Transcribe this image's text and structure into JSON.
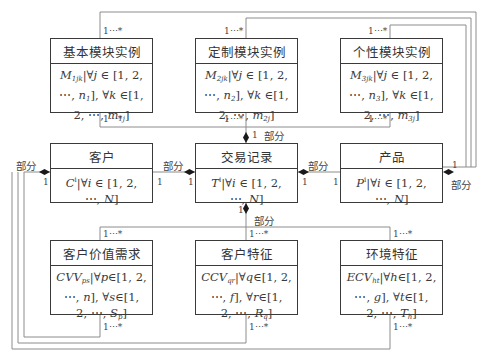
{
  "diagram": {
    "type": "uml-class-diagram",
    "classes": {
      "basic_module": {
        "name": "基本模块实例",
        "attr_lines": [
          "M<sub>1jk</sub>|∀<i>j</i> ∈ [1, 2,",
          "⋯, <i>n</i><sub>1</sub>], ∀<i>k</i> ∈[1,",
          "2, ⋯, <i>m</i><sub>1j</sub>]"
        ],
        "attr_text": "M1jk|∀j ∈ [1, 2, ⋯, n1], ∀k ∈[1, 2, ⋯, m1j]"
      },
      "custom_module": {
        "name": "定制模块实例",
        "attr_text": "M2jk|∀j ∈ [1, 2, ⋯, n2], ∀k ∈[1, 2, ⋯, m2j]"
      },
      "personal_module": {
        "name": "个性模块实例",
        "attr_text": "M3jk|∀j ∈ [1, 2, ⋯, n3], ∀k ∈[1, 2, ⋯, m3j]"
      },
      "customer": {
        "name": "客户",
        "attr_text": "C^i|∀i ∈ [1, 2, ⋯, N]"
      },
      "transaction": {
        "name": "交易记录",
        "attr_text": "T^i|∀i ∈ [1, 2, ⋯, N]"
      },
      "product": {
        "name": "产品",
        "attr_text": "P^i|∀i ∈ [1, 2, ⋯, N]"
      },
      "customer_value_need": {
        "name": "客户价值需求",
        "attr_text": "CVVps|∀p∈[1, 2, ⋯, n], ∀s∈[1, 2, ⋯, Sp]"
      },
      "customer_feature": {
        "name": "客户特征",
        "attr_text": "CCVqr|∀q∈[1, 2, ⋯, f], ∀r∈[1, 2, ⋯, Rq]"
      },
      "environment_feature": {
        "name": "环境特征",
        "attr_text": "ECVht|∀h∈[1, 2, ⋯, g], ∀t∈[1, 2, ⋯, Th]"
      }
    },
    "labels": {
      "part": "部分",
      "one": "1",
      "one_to_many": "1⋯*"
    },
    "relations": [
      {
        "from": "transaction",
        "to": "basic_module",
        "type": "composition",
        "whole_mult": "1",
        "part_mult": "1⋯*",
        "role": "部分"
      },
      {
        "from": "transaction",
        "to": "custom_module",
        "type": "composition",
        "whole_mult": "1",
        "part_mult": "1⋯*",
        "role": "部分"
      },
      {
        "from": "transaction",
        "to": "personal_module",
        "type": "composition",
        "whole_mult": "1",
        "part_mult": "1⋯*",
        "role": "部分"
      },
      {
        "from": "product",
        "to": "basic_module",
        "type": "composition",
        "whole_mult": "1",
        "part_mult": "1⋯*",
        "role": "部分"
      },
      {
        "from": "product",
        "to": "custom_module",
        "type": "composition",
        "whole_mult": "1",
        "part_mult": "1⋯*",
        "role": "部分"
      },
      {
        "from": "product",
        "to": "personal_module",
        "type": "composition",
        "whole_mult": "1",
        "part_mult": "1⋯*",
        "role": "部分"
      },
      {
        "from": "transaction",
        "to": "customer",
        "type": "composition",
        "whole_mult": "1",
        "part_mult": "1",
        "role": "部分"
      },
      {
        "from": "transaction",
        "to": "product",
        "type": "composition",
        "whole_mult": "1",
        "part_mult": "1",
        "role": "部分"
      },
      {
        "from": "transaction",
        "to": "customer_value_need",
        "type": "composition",
        "whole_mult": "1",
        "part_mult": "1⋯*",
        "role": "部分"
      },
      {
        "from": "transaction",
        "to": "customer_feature",
        "type": "composition",
        "whole_mult": "1",
        "part_mult": "1⋯*",
        "role": "部分"
      },
      {
        "from": "transaction",
        "to": "environment_feature",
        "type": "composition",
        "whole_mult": "1",
        "part_mult": "1⋯*",
        "role": "部分"
      },
      {
        "from": "customer",
        "to": "customer_value_need",
        "type": "composition",
        "whole_mult": "1",
        "part_mult": "1⋯*",
        "role": "部分"
      },
      {
        "from": "customer",
        "to": "customer_feature",
        "type": "composition",
        "whole_mult": "1",
        "part_mult": "1⋯*",
        "role": "部分"
      },
      {
        "from": "customer",
        "to": "environment_feature",
        "type": "composition",
        "whole_mult": "1",
        "part_mult": "1⋯*",
        "role": "部分"
      }
    ],
    "colors": {
      "line": "#8a8a8a",
      "box_border": "#3a3a3a",
      "text": "#2a2a2a"
    }
  }
}
